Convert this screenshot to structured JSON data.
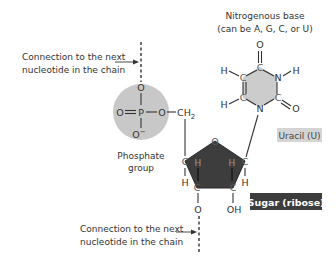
{
  "figure": {
    "title_base": "Nitrogenous base",
    "subtitle_base": "(can be A, G, C, or U)",
    "connection_top": {
      "line1": "Connection to the next",
      "line2": "nucleotide in the chain"
    },
    "connection_bottom": {
      "line1": "Connection to the next",
      "line2": "nucleotide in the chain"
    },
    "phosphate_label": {
      "line1": "Phosphate",
      "line2": "group"
    },
    "uracil_label": "Uracil (U)",
    "sugar_label": "Sugar (ribose)"
  },
  "atoms": {
    "phosphate": {
      "top_o": "O",
      "p": "P",
      "left_o": "O",
      "right_o": "O",
      "bottom_o": "O",
      "bottom_charge": "−",
      "ch2": "CH",
      "ch2_sub": "2"
    },
    "uracil": {
      "o_top": "O",
      "c4": "C",
      "n3": "N",
      "h_n3": "H",
      "c2": "C",
      "o_c2": "O",
      "n1": "N",
      "c6": "C",
      "h_c6": "H",
      "c5": "C",
      "h_c5": "H"
    },
    "ribose": {
      "o_ring": "O",
      "c4": "C",
      "c1": "C",
      "c3": "C",
      "c2": "C",
      "h_c4_in": "H",
      "h_c1_in": "H",
      "h_c4_out": "H",
      "h_c1_out": "H",
      "o3": "O",
      "oh": "OH"
    }
  },
  "colors": {
    "phosphate_fill": "#c8c8c8",
    "uracil_fill": "#cccccc",
    "sugar_fill": "#3d3d3d",
    "sugar_label_bg": "#3d3d3d",
    "sugar_label_text": "#ffffff",
    "uracil_label_bg": "#d4d4d4",
    "text": "#333333"
  }
}
